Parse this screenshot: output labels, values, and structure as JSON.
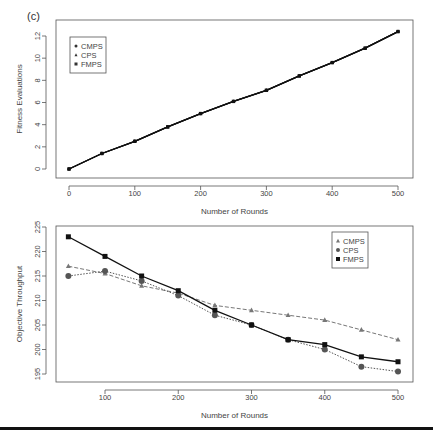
{
  "figure": {
    "panel_label": "(c)"
  },
  "chart_data": [
    {
      "type": "line",
      "title": "",
      "xlabel": "Number of Rounds",
      "ylabel": "Fitness Evaluations",
      "xlim": [
        0,
        500
      ],
      "ylim": [
        0,
        12
      ],
      "x_ticks": [
        0,
        100,
        200,
        300,
        400,
        500
      ],
      "y_ticks": [
        0,
        2,
        4,
        6,
        8,
        10,
        12
      ],
      "grid": false,
      "legend_position": "top-left",
      "x": [
        0,
        50,
        100,
        150,
        200,
        250,
        300,
        350,
        400,
        450,
        500
      ],
      "series": [
        {
          "name": "CMPS",
          "marker": "circle",
          "values": [
            0,
            1.4,
            2.5,
            3.8,
            5.0,
            6.1,
            7.1,
            8.4,
            9.6,
            10.9,
            12.4
          ]
        },
        {
          "name": "CPS",
          "marker": "triangle",
          "values": [
            0,
            1.4,
            2.5,
            3.8,
            5.0,
            6.1,
            7.1,
            8.4,
            9.6,
            10.9,
            12.4
          ]
        },
        {
          "name": "FMPS",
          "marker": "square",
          "values": [
            0,
            1.4,
            2.5,
            3.8,
            5.0,
            6.1,
            7.1,
            8.4,
            9.6,
            10.9,
            12.4
          ]
        }
      ]
    },
    {
      "type": "line",
      "title": "",
      "xlabel": "Number of Rounds",
      "ylabel": "Objective Throughput",
      "xlim": [
        50,
        500
      ],
      "ylim": [
        195,
        225
      ],
      "x_ticks": [
        100,
        200,
        300,
        400,
        500
      ],
      "y_ticks": [
        195,
        200,
        205,
        210,
        215,
        220,
        225
      ],
      "grid": false,
      "legend_position": "top-right",
      "x": [
        50,
        100,
        150,
        200,
        250,
        300,
        350,
        400,
        450,
        500
      ],
      "series": [
        {
          "name": "CMPS",
          "marker": "triangle",
          "line": "dashed",
          "color": "#777777",
          "values": [
            217,
            215.5,
            213,
            211.5,
            209,
            208,
            207,
            206,
            204,
            202
          ]
        },
        {
          "name": "CPS",
          "marker": "circle",
          "line": "dotted",
          "color": "#555555",
          "values": [
            215,
            216,
            214,
            211,
            207,
            205,
            202,
            200,
            196.5,
            195.5
          ]
        },
        {
          "name": "FMPS",
          "marker": "square",
          "line": "solid",
          "color": "#111111",
          "values": [
            223,
            219,
            215,
            212,
            208,
            205,
            202,
            201,
            198.5,
            197.5
          ]
        }
      ]
    }
  ]
}
